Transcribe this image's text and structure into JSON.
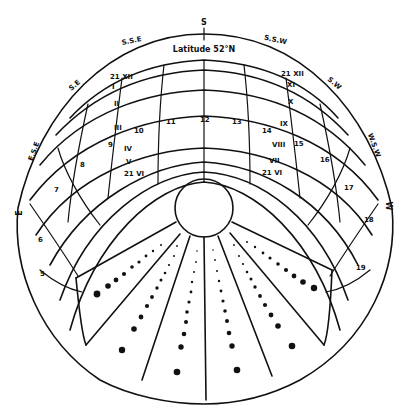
{
  "diagram": {
    "title": "Latitude 52°N",
    "compass": {
      "S": "S",
      "SSE": "S.S.E",
      "SSW": "S.S.W",
      "SE": "S.E",
      "SW": "S.W",
      "ESE": "E.S.E",
      "WSW": "W.S.W",
      "E": "E",
      "W": "W"
    },
    "month_labels": {
      "dec_21": "21 XII",
      "jan_nov_left": "I",
      "feb_oct_left": "II",
      "mar_sep_left": "III",
      "apr_aug_left": "IV",
      "may_jul_left": "V",
      "jun_21_left": "21 VI",
      "nov_right": "XI",
      "oct_right": "X",
      "sep_right": "IX",
      "aug_right": "VIII",
      "jul_right": "VII",
      "jun_21_right": "21 VI",
      "dec_21_right": "21 XII"
    },
    "hour_labels": {
      "h5": "5",
      "h6": "6",
      "h7": "7",
      "h8": "8",
      "h9": "9",
      "h10": "10",
      "h11": "11",
      "h12": "12",
      "h13": "13",
      "h14": "14",
      "h15": "15",
      "h16": "16",
      "h17": "17",
      "h18": "18",
      "h19": "19"
    },
    "colors": {
      "ink": "#111111",
      "paper": "#ffffff"
    }
  }
}
